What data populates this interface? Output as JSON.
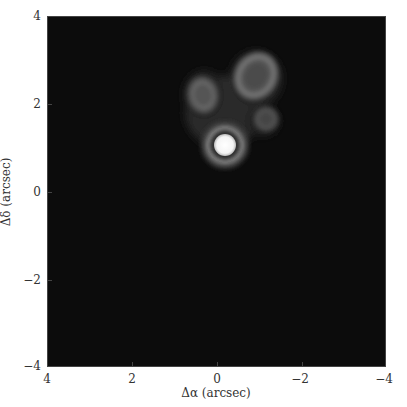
{
  "figure": {
    "xlabel": "Δα (arcsec)",
    "ylabel": "Δδ (arcsec)",
    "x_ticks": [
      "4",
      "2",
      "0",
      "−2",
      "−4"
    ],
    "y_ticks": [
      "4",
      "2",
      "0",
      "−2",
      "−4"
    ],
    "xlim": [
      4,
      -4
    ],
    "ylim": [
      -4,
      4
    ],
    "background_color": "#0c0c0c"
  },
  "sources": [
    {
      "name": "core",
      "dalpha": -0.2,
      "ddelta": 1.1,
      "brightness": "saturated"
    },
    {
      "name": "knot-northwest",
      "dalpha": -0.9,
      "ddelta": 2.7,
      "brightness": "medium"
    },
    {
      "name": "knot-northeast",
      "dalpha": 0.35,
      "ddelta": 2.3,
      "brightness": "faint"
    },
    {
      "name": "knot-west",
      "dalpha": -1.15,
      "ddelta": 1.7,
      "brightness": "faint"
    }
  ]
}
